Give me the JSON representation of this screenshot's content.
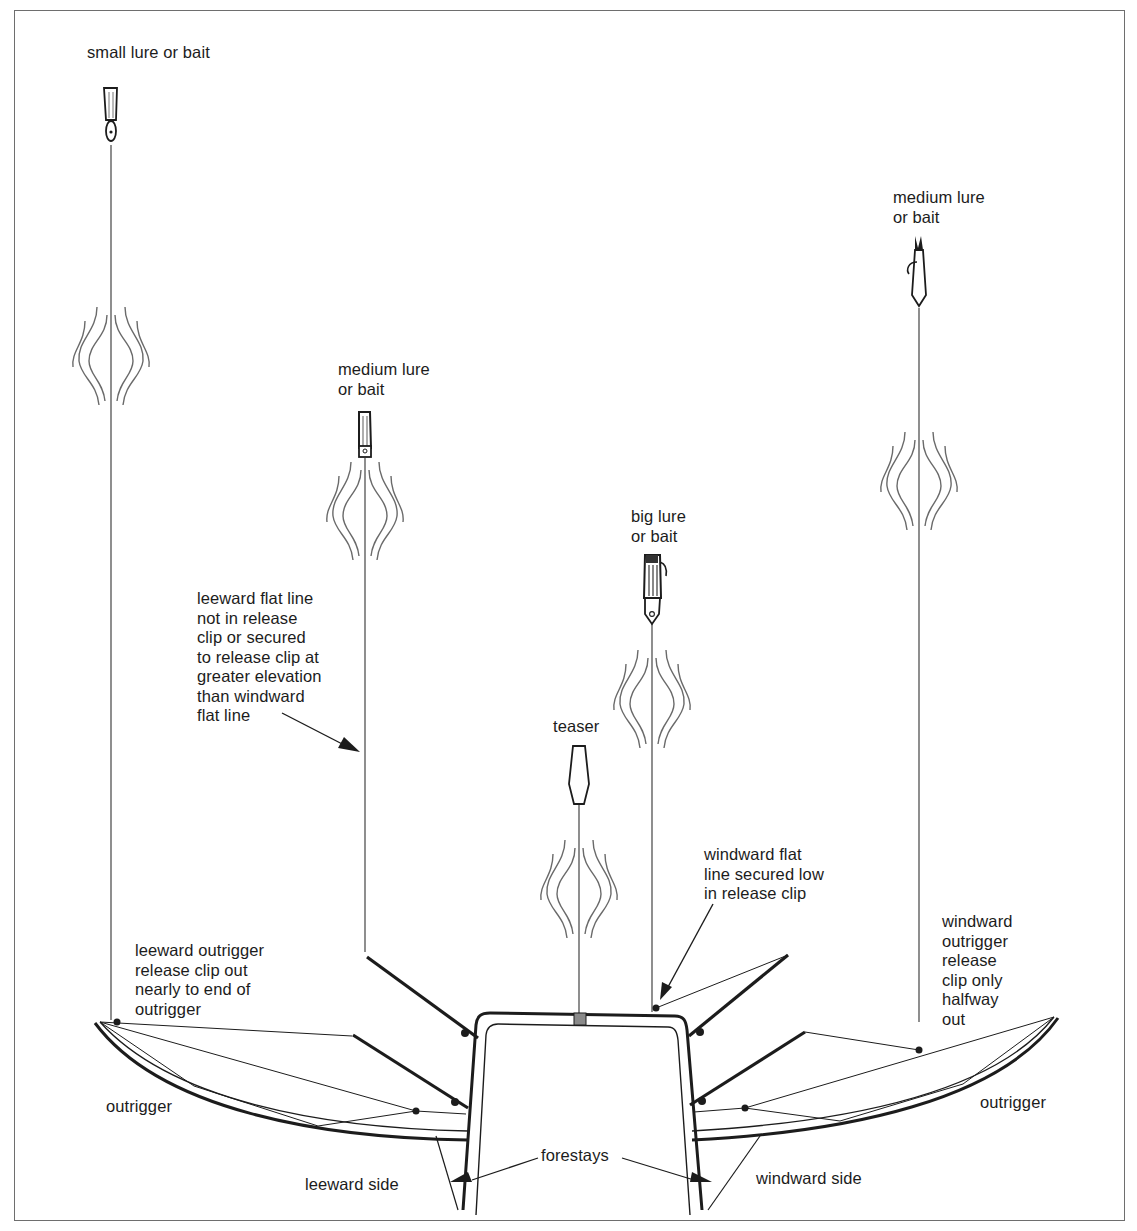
{
  "diagram": {
    "type": "fishing-spread-boat-diagram",
    "colors": {
      "line": "#1c1c1c",
      "wake": "#6a6a6a",
      "frame": "#6e6e6e",
      "teaser_clip": "#8a8a8a"
    },
    "labels": {
      "small_lure": "small lure or bait",
      "medium_lure_left": "medium lure\nor bait",
      "medium_lure_right": "medium lure\nor bait",
      "big_lure": "big lure\nor bait",
      "teaser": "teaser",
      "leeward_flat_line": "leeward flat line\nnot in release\nclip or secured\nto release clip at\ngreater elevation\nthan windward\nflat line",
      "windward_flat_line": "windward flat\nline secured low\nin release clip",
      "leeward_outrigger_clip": "leeward outrigger\nrelease clip out\nnearly to end of\noutrigger",
      "windward_outrigger_clip": "windward\noutrigger\nrelease\nclip only\nhalfway\nout",
      "outrigger_left": "outrigger",
      "outrigger_right": "outrigger",
      "forestays": "forestays",
      "leeward_side": "leeward side",
      "windward_side": "windward side"
    }
  }
}
